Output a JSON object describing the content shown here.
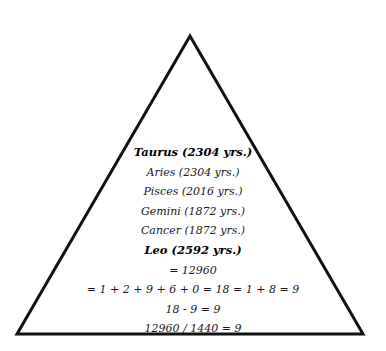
{
  "diagram": {
    "shape": "triangle",
    "stroke_color": "#111111",
    "background_color": "#ffffff",
    "vertices": {
      "apex": [
        190,
        36
      ],
      "bottom_left": [
        17,
        334
      ],
      "bottom_right": [
        363,
        334
      ]
    }
  },
  "lines": [
    {
      "text": "Taurus (2304 yrs.)",
      "bold": true
    },
    {
      "text": "Aries (2304 yrs.)",
      "bold": false
    },
    {
      "text": "Pisces (2016 yrs.)",
      "bold": false
    },
    {
      "text": "Gemini (1872 yrs.)",
      "bold": false
    },
    {
      "text": "Cancer (1872 yrs.)",
      "bold": false
    },
    {
      "text": "Leo (2592 yrs.)",
      "bold": true
    },
    {
      "text": "= 12960",
      "bold": false
    },
    {
      "text": "= 1 + 2 + 9 + 6 + 0 = 18 = 1 + 8 = 9",
      "bold": false
    },
    {
      "text": "18 - 9 = 9",
      "bold": false
    },
    {
      "text": "12960 / 1440 = 9",
      "bold": false
    }
  ]
}
